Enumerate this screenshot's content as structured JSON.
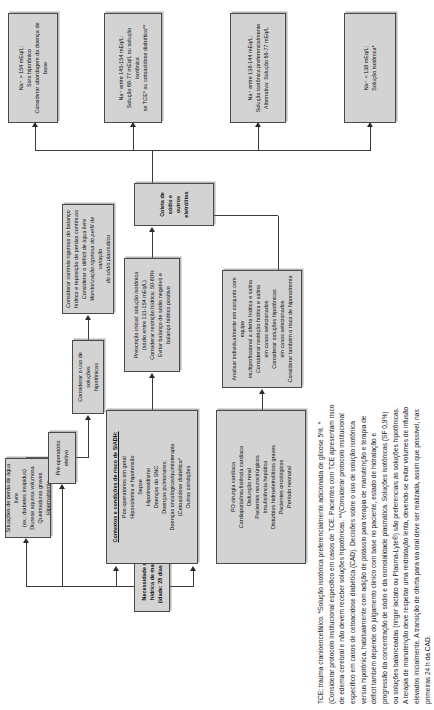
{
  "diagram": {
    "title_node": {
      "line1": "Necessidade de terapia hídrica de manutenção",
      "line2": "(idade: 28 dias – 18 anos)"
    },
    "risk_box": {
      "heading": "Contextos e condições de risco de SIADH:",
      "items": [
        "Pós-operatórios em geral",
        "Hipovolemia e hipotensão",
        "Sepse",
        "Hipotireoidismo",
        "Doenças do SNC",
        "Doenças pulmonares;",
        "Doenças oncológicas/quimioterapia",
        "(Cetoacidose diabética*",
        "Outras condições"
      ]
    },
    "special_box": {
      "items": [
        "PO cirurgia cardíaca",
        "Cardiopatia/insuficiência cardíaca",
        "Disfunção renal",
        "Pacientes neurocirúrgicos",
        "Insuficiência hepática",
        "Distúrbios hidroeletrolíticos graves",
        "Pacientes oncológicos",
        "Período neonatal"
      ]
    },
    "free_water_loss_box": {
      "items": [
        "Situações de perda de água livre",
        "(ex.: diabetes insipidus)",
        "Diurese aquosa volumosa",
        "Queimaduras graves",
        "Hipernatremia"
      ]
    },
    "preop_box": {
      "items": [
        "Pré-operatório",
        "eletivo"
      ]
    },
    "hypotonic_box": {
      "items": [
        "Considerar o uso de soluções",
        "hipotônicas"
      ]
    },
    "strict_control_box": {
      "items": [
        "Considerar controle rigoroso do balanço",
        "hídrico e reposição de perdas contínuas",
        "Considerar o déficit de água livre",
        "Monitorização rigorosa do perfil de variação",
        "do sódio plasmático"
      ]
    },
    "individual_box": {
      "items": [
        "Analisar individualmente em conjunto com equipe",
        "multiprofissional a oferta hídrica e salina",
        "Considerar restrição hídrica e salina",
        "em casos selecionados",
        "Considerar soluções hipotônicas",
        "em casos selecionados",
        "Considerar também o risco de hiponatremia"
      ]
    },
    "prescription_box": {
      "items": [
        "Prescrição inicial: solução isotônica",
        "(sódio entre 131-154 mEq/L)",
        "Considerar restrição hídrica: 50-80%",
        "Evitar balanço de sódio negativo e",
        "balanço hídrico positivo"
      ]
    },
    "collect_box": {
      "label": "Coleta de sódio e outros eletrólitos"
    },
    "outcomes": [
      {
        "id": "na-low",
        "items": [
          "Na⁺ < 138 mEq/L:",
          "Solução isotônica*"
        ]
      },
      {
        "id": "na-normal",
        "items": [
          "Na⁺ entre 138-144 mEq/L:",
          "Solução isotônica preferencialmente",
          "Alternativa: Solução 68-77 mEq/L"
        ]
      },
      {
        "id": "na-high",
        "items": [
          "Na⁺ entre 145-154 mEq/L:",
          "Solução 68-77 mEq/L ou solução isotônica",
          "se TCE* ou cetoacidose diabética**"
        ]
      },
      {
        "id": "na-very-high",
        "items": [
          "Na⁺ > 154 mEq/L:",
          "Soro hipotônico",
          "Considerar abordagem da doença de base"
        ]
      }
    ],
    "footnote": "TCE: trauma cranioencefálico. *Solução isotônica preferencialmente adicionada de glicose 5%. *(Considerar protocolo institucional específico em casos de TCE. Pacientes com TCE apresentam risco de edema cerebral e não devem receber soluções hipotônicas. **(Considerar protocolo institucional específico em casos de cetoacidose diabética (CAD). Decisões sobre o uso de solução isotônica versus hipotônica, habitualmente com adição de potássio para terapia de manutenção e terapia de déficit também depende do julgamento clínico com base no paciente, estado de hidratação e progressão da concentração de sódio e da osmolalidade plasmática. Soluções isotônicas (SF 0,9%) ou soluções balanceadas (ringer lactato ou Plasma-Lyte®) são preferenciais às soluções hipotônicas. A terapia de manutenção deve respeitar uma reidratação lenta, devendo-se evitar volumes de infusão elevados inicialmente. A transição de oferta para via oral deve ser realizada, assim que possível, nas primeiras 24 h da CAD.",
    "colors": {
      "box_fill": "#d3d3d3",
      "box_border": "#4a4a4a",
      "connector": "#3a3a3a",
      "text": "#111111"
    }
  }
}
